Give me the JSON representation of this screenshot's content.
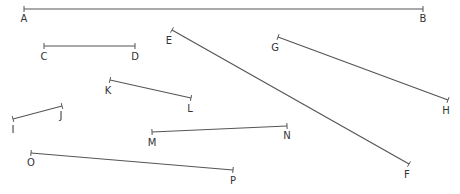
{
  "diagram": {
    "type": "line-segments",
    "width": 460,
    "height": 194,
    "color": "#555555",
    "label_color": "#333333",
    "segments": [
      {
        "name": "AB",
        "p1": {
          "label": "A",
          "x": 24,
          "y": 9,
          "lx": 24,
          "ly": 22
        },
        "p2": {
          "label": "B",
          "x": 423,
          "y": 9,
          "lx": 423,
          "ly": 22
        }
      },
      {
        "name": "CD",
        "p1": {
          "label": "C",
          "x": 44,
          "y": 46,
          "lx": 44,
          "ly": 60
        },
        "p2": {
          "label": "D",
          "x": 135,
          "y": 46,
          "lx": 135,
          "ly": 60
        }
      },
      {
        "name": "EF",
        "p1": {
          "label": "E",
          "x": 172,
          "y": 30,
          "lx": 169,
          "ly": 44
        },
        "p2": {
          "label": "F",
          "x": 409,
          "y": 164,
          "lx": 407,
          "ly": 178
        }
      },
      {
        "name": "GH",
        "p1": {
          "label": "G",
          "x": 278,
          "y": 37,
          "lx": 275,
          "ly": 51
        },
        "p2": {
          "label": "H",
          "x": 448,
          "y": 100,
          "lx": 446,
          "ly": 114
        }
      },
      {
        "name": "KL",
        "p1": {
          "label": "K",
          "x": 110,
          "y": 80,
          "lx": 108,
          "ly": 94
        },
        "p2": {
          "label": "L",
          "x": 191,
          "y": 98,
          "lx": 190,
          "ly": 112
        }
      },
      {
        "name": "IJ",
        "p1": {
          "label": "I",
          "x": 13,
          "y": 119,
          "lx": 13,
          "ly": 133
        },
        "p2": {
          "label": "J",
          "x": 62,
          "y": 106,
          "lx": 61,
          "ly": 119
        }
      },
      {
        "name": "MN",
        "p1": {
          "label": "M",
          "x": 152,
          "y": 132,
          "lx": 152,
          "ly": 146
        },
        "p2": {
          "label": "N",
          "x": 287,
          "y": 126,
          "lx": 287,
          "ly": 139
        }
      },
      {
        "name": "OP",
        "p1": {
          "label": "O",
          "x": 31,
          "y": 153,
          "lx": 31,
          "ly": 166
        },
        "p2": {
          "label": "P",
          "x": 233,
          "y": 170,
          "lx": 233,
          "ly": 184
        }
      }
    ]
  }
}
